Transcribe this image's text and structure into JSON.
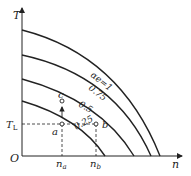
{
  "diagram": {
    "axes": {
      "y_label": "T",
      "x_label": "n",
      "origin": "O"
    },
    "curves": [
      {
        "label": "αe=1"
      },
      {
        "label": "0.75"
      },
      {
        "label": "0.5"
      },
      {
        "label": "0.25"
      }
    ],
    "points": {
      "a": "a",
      "b": "b",
      "c": "c"
    },
    "ticks": {
      "TL": "T",
      "TL_sub": "L",
      "na": "n",
      "na_sub": "a",
      "nb": "n",
      "nb_sub": "b"
    }
  }
}
